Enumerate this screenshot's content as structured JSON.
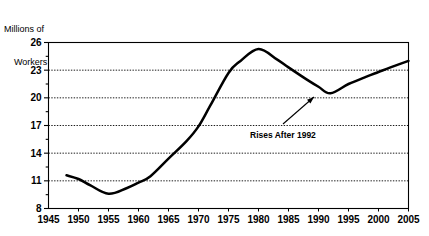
{
  "chart_data": {
    "type": "line",
    "title": "",
    "subtitle": "",
    "ylabel_line1": "Millions of",
    "ylabel_line2": "Workers",
    "xlabel": "",
    "ylim": [
      8,
      26
    ],
    "xlim": [
      1945,
      2005
    ],
    "grid": true,
    "grid_values": [
      11,
      14,
      17,
      20,
      23
    ],
    "ytick_labels": [
      "26",
      "23",
      "20",
      "17",
      "14",
      "11",
      "8"
    ],
    "ytick_values": [
      26,
      23,
      20,
      17,
      14,
      11,
      8
    ],
    "yminor_values": [
      24.5,
      21.5,
      18.5,
      15.5,
      12.5,
      9.5
    ],
    "xtick_labels": [
      "1945",
      "1950",
      "1955",
      "1960",
      "1965",
      "1970",
      "1975",
      "1980",
      "1985",
      "1990",
      "1995",
      "2000",
      "2005"
    ],
    "xtick_values": [
      1945,
      1950,
      1955,
      1960,
      1965,
      1970,
      1975,
      1980,
      1985,
      1990,
      1995,
      2000,
      2005
    ],
    "legend": [],
    "legend_position": "none",
    "series": [
      {
        "name": "Workers",
        "x": [
          1948,
          1950,
          1952,
          1955,
          1958,
          1960,
          1962,
          1965,
          1968,
          1970,
          1972,
          1975,
          1977,
          1980,
          1983,
          1985,
          1988,
          1990,
          1992,
          1995,
          1998,
          2000,
          2002,
          2005
        ],
        "values": [
          11.6,
          11.2,
          10.5,
          9.6,
          10.2,
          10.8,
          11.5,
          13.4,
          15.3,
          16.9,
          19.2,
          22.7,
          24.0,
          25.3,
          24.2,
          23.3,
          22.0,
          21.2,
          20.5,
          21.5,
          22.3,
          22.8,
          23.3,
          24.0
        ]
      }
    ],
    "annotations": [
      {
        "text": "Rises After 1992",
        "text_x": 250,
        "text_y": 138,
        "arrow_from_x": 283,
        "arrow_from_y": 124,
        "arrow_to_x": 314,
        "arrow_to_y": 97
      }
    ],
    "colors": {
      "line": "#000000",
      "grid": "#000000",
      "frame": "#000000",
      "background": "#ffffff",
      "text": "#000000"
    }
  }
}
